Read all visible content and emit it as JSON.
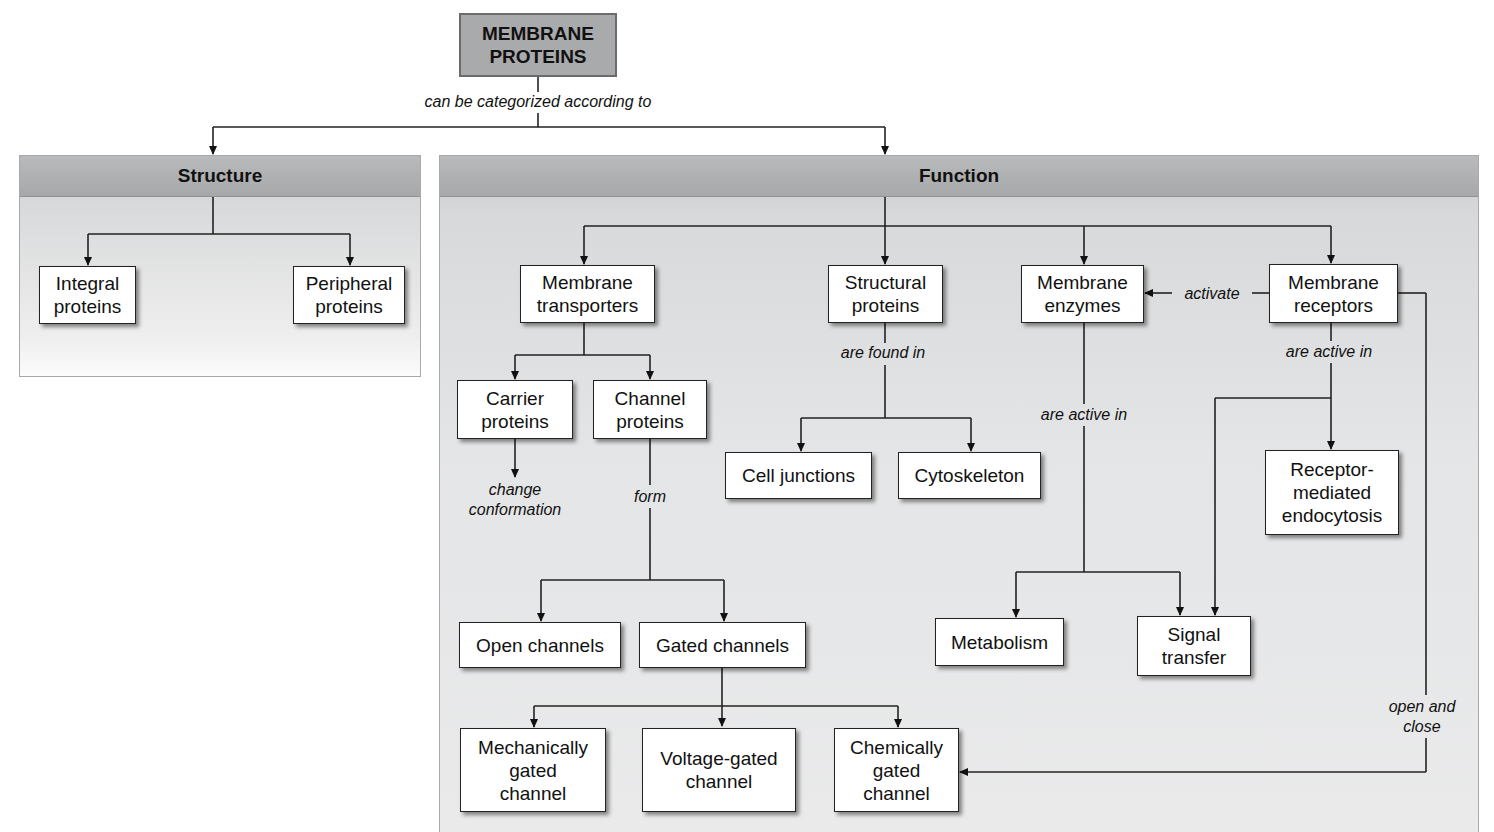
{
  "root": {
    "label": "MEMBRANE\nPROTEINS"
  },
  "root_link": "can be categorized according to",
  "structure": {
    "title": "Structure",
    "nodes": {
      "integral": "Integral\nproteins",
      "peripheral": "Peripheral\nproteins"
    }
  },
  "function": {
    "title": "Function",
    "nodes": {
      "transporters": "Membrane\ntransporters",
      "structural": "Structural\nproteins",
      "enzymes": "Membrane\nenzymes",
      "receptors": "Membrane\nreceptors",
      "carrier": "Carrier\nproteins",
      "channel": "Channel\nproteins",
      "cell_junctions": "Cell junctions",
      "cytoskeleton": "Cytoskeleton",
      "rme": "Receptor-\nmediated\nendocytosis",
      "open_channels": "Open channels",
      "gated_channels": "Gated channels",
      "metabolism": "Metabolism",
      "signal_transfer": "Signal\ntransfer",
      "mechanically": "Mechanically\ngated\nchannel",
      "voltage": "Voltage-gated\nchannel",
      "chemically": "Chemically\ngated\nchannel"
    },
    "links": {
      "activate": "activate",
      "are_found_in": "are found in",
      "are_active_in_receptors": "are active in",
      "are_active_in_enzymes": "are active in",
      "change_conformation": "change\nconformation",
      "form": "form",
      "open_and_close": "open and\nclose"
    }
  }
}
